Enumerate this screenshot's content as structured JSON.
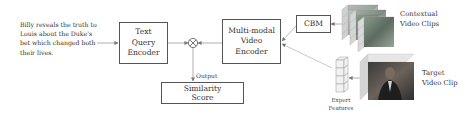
{
  "diagram": {
    "query_text": "Billy reveals the truth to Louis about the Duke's bet which changed both their lives.",
    "nodes": {
      "text_query_encoder": {
        "lines": [
          "Text",
          "Query",
          "Encoder"
        ]
      },
      "multimodal_video_encoder": {
        "lines": [
          "Multi-modal",
          "Video",
          "Encoder"
        ]
      },
      "cbm": {
        "label": "CBM"
      },
      "similarity_score": {
        "lines": [
          "Similarity",
          "Score"
        ]
      },
      "combine_operator": {
        "symbol": "⊗"
      }
    },
    "labels": {
      "output": "Output",
      "contextual_clips": [
        "Contextual",
        "Video Clips"
      ],
      "target_clip": [
        "Target",
        "Video Clip"
      ],
      "expert_features": [
        "Expert",
        "Features"
      ]
    },
    "edges": [
      {
        "from": "query_text",
        "to": "text_query_encoder"
      },
      {
        "from": "text_query_encoder",
        "to": "combine_operator"
      },
      {
        "from": "multimodal_video_encoder",
        "to": "combine_operator"
      },
      {
        "from": "combine_operator",
        "to": "similarity_score",
        "label": "Output"
      },
      {
        "from": "cbm",
        "to": "multimodal_video_encoder"
      },
      {
        "from": "expert_features",
        "to": "multimodal_video_encoder"
      },
      {
        "from": "contextual_video_clips",
        "to": "cbm"
      },
      {
        "from": "target_video_clip",
        "to": "expert_features"
      }
    ]
  }
}
